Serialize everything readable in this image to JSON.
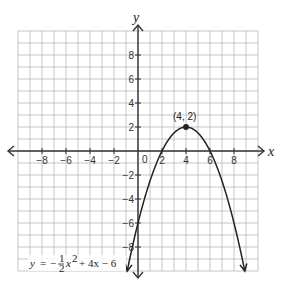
{
  "chart_data": {
    "type": "line",
    "title": "",
    "xlabel": "x",
    "ylabel": "y",
    "xlim": [
      -10,
      10
    ],
    "ylim": [
      -10,
      10
    ],
    "grid": true,
    "x_tick_labels": [
      "-8",
      "-6",
      "-4",
      "-2",
      "0",
      "2",
      "4",
      "6",
      "8"
    ],
    "y_tick_labels": [
      "8",
      "6",
      "4",
      "2",
      "-2",
      "-4",
      "-6",
      "-8"
    ],
    "series": [
      {
        "name": "y = -1/2 x^2 + 4x - 6",
        "equation": "y = -(1/2)x^2 + 4x - 6",
        "x": [
          -0.9,
          0,
          1,
          2,
          3,
          4,
          5,
          6,
          7,
          8,
          8.9
        ],
        "y": [
          -10,
          -6,
          -2.5,
          0,
          1.5,
          2,
          1.5,
          0,
          -2.5,
          -6,
          -10
        ]
      }
    ],
    "annotations": [
      {
        "text": "(4, 2)",
        "x": 4,
        "y": 2,
        "marker": "point"
      }
    ],
    "legend_position": "none"
  },
  "labels": {
    "x_axis": "x",
    "y_axis": "y",
    "vertex": "(4, 2)",
    "origin": "0",
    "equation_y": "y",
    "equation_eq": "=",
    "equation_minus": "−",
    "equation_num": "1",
    "equation_den": "2",
    "equation_x2": "x",
    "equation_exp": "2",
    "equation_rest": "+ 4x − 6"
  },
  "colors": {
    "grid": "#b8b8b8",
    "axis": "#333333",
    "curve": "#222222"
  }
}
